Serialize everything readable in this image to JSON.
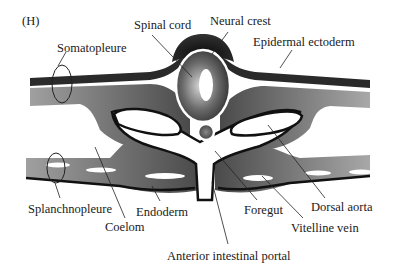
{
  "panel_label": "(H)",
  "labels": {
    "spinal_cord": "Spinal cord",
    "neural_crest": "Neural crest",
    "epidermal_ectoderm": "Epidermal ectoderm",
    "somatopleure": "Somatopleure",
    "splanchnopleure": "Splanchnopleure",
    "coelom": "Coelom",
    "endoderm": "Endoderm",
    "foregut": "Foregut",
    "dorsal_aorta": "Dorsal aorta",
    "vitelline_vein": "Vitelline vein",
    "anterior_intestinal_portal": "Anterior intestinal portal"
  },
  "colors": {
    "ectoderm": "#2e2e2e",
    "mesoderm_light": "#9a9a9a",
    "mesoderm_dark": "#4a4a4a",
    "outline": "#111111",
    "background": "#ffffff"
  }
}
